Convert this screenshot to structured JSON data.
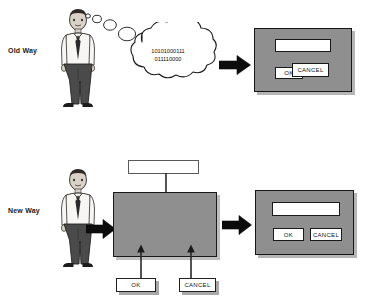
{
  "diagram": {
    "rows": [
      {
        "id": "old-way",
        "label": "Old Way",
        "person": {
          "icon": "businessman-figure",
          "alt": "developer standing"
        },
        "thought": {
          "icon": "thought-cloud",
          "lines": [
            "10101000111",
            "011110000"
          ]
        },
        "flow_arrow": {
          "icon": "right-arrow"
        },
        "dialog": {
          "name": "old-way-dialog",
          "field": {
            "value": ""
          },
          "buttons": [
            {
              "label": "OK",
              "name": "ok-button"
            },
            {
              "label": "CANCEL",
              "name": "cancel-button"
            }
          ]
        }
      },
      {
        "id": "new-way",
        "label": "New Way",
        "person": {
          "icon": "businessman-figure",
          "alt": "developer standing"
        },
        "flow_arrow_left": {
          "icon": "right-arrow"
        },
        "flow_arrow_right": {
          "icon": "right-arrow"
        },
        "canvas": {
          "name": "form-designer-canvas",
          "drop_arrows": [
            {
              "icon": "down-arrow",
              "name": "drop-arrow-field"
            },
            {
              "icon": "up-arrow",
              "name": "drop-arrow-ok"
            },
            {
              "icon": "up-arrow",
              "name": "drop-arrow-cancel"
            }
          ]
        },
        "palette": [
          {
            "name": "palette-textbox",
            "label": "",
            "type": "textbox"
          },
          {
            "name": "palette-ok-button",
            "label": "OK",
            "type": "button"
          },
          {
            "name": "palette-cancel-button",
            "label": "CANCEL",
            "type": "button"
          }
        ],
        "dialog": {
          "name": "new-way-dialog",
          "field": {
            "value": ""
          },
          "buttons": [
            {
              "label": "OK",
              "name": "ok-button"
            },
            {
              "label": "CANCEL",
              "name": "cancel-button"
            }
          ]
        }
      }
    ],
    "colors": {
      "dialog_bg": "#8f8f8f",
      "widget_bg": "#ffffff",
      "outline": "#1a1a1a",
      "page_bg": "#ffffff"
    }
  }
}
